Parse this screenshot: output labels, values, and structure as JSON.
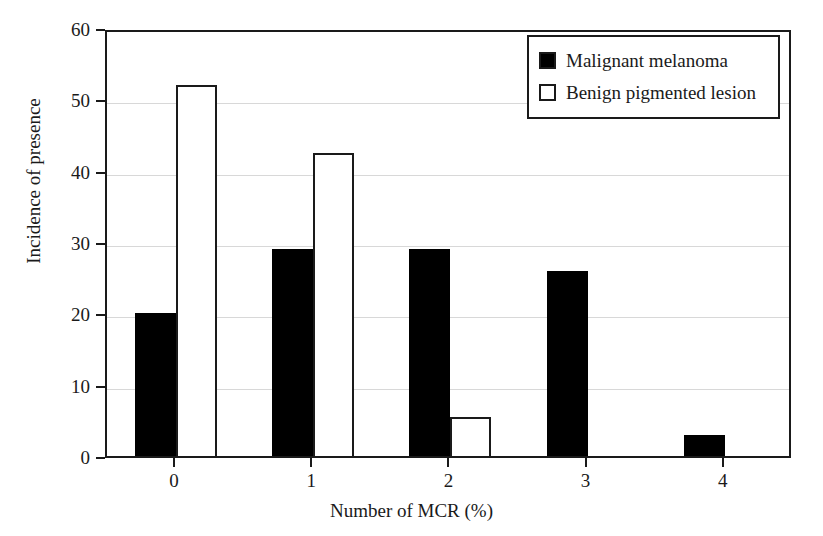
{
  "chart_data": {
    "type": "bar",
    "title": "",
    "xlabel": "Number of MCR (%)",
    "ylabel": "Incidence of presence",
    "categories": [
      "0",
      "1",
      "2",
      "3",
      "4"
    ],
    "series": [
      {
        "name": "Malignant melanoma",
        "fill": "#000000",
        "style": "filled",
        "values": [
          20,
          29,
          29,
          26,
          3
        ]
      },
      {
        "name": "Benign pigmented lesion",
        "fill": "#ffffff",
        "style": "open",
        "values": [
          52,
          42.5,
          5.5,
          0,
          0
        ]
      }
    ],
    "ylim": [
      0,
      60
    ],
    "yticks": [
      0,
      10,
      20,
      30,
      40,
      50,
      60
    ],
    "ytick_labels": [
      "0",
      "10",
      "20",
      "30",
      "40",
      "50",
      "60"
    ],
    "xtick_labels": [
      "0",
      "1",
      "2",
      "3",
      "4"
    ],
    "grid": true,
    "grid_axis": "y",
    "grid_color": "#d8d8d8",
    "legend_position": "top-right",
    "axis_color": "#1a1a1a",
    "background": "#ffffff"
  },
  "legend": {
    "entries": [
      {
        "label": "Malignant melanoma",
        "swatch": "filled-square"
      },
      {
        "label": "Benign pigmented lesion",
        "swatch": "open-square"
      }
    ]
  },
  "axes": {
    "y_label": "Incidence of presence",
    "x_label": "Number of MCR (%)",
    "y_ticks": [
      "0",
      "10",
      "20",
      "30",
      "40",
      "50",
      "60"
    ],
    "x_ticks": [
      "0",
      "1",
      "2",
      "3",
      "4"
    ]
  }
}
